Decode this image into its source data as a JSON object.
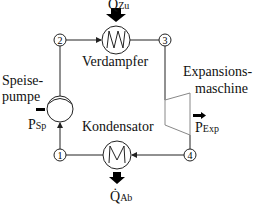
{
  "diagram": {
    "type": "Organic Rankine Cycle schematic",
    "components": {
      "pump": {
        "label_line1": "Speise-",
        "label_line2": "pumpe"
      },
      "evaporator": {
        "label": "Verdampfer"
      },
      "expander": {
        "label_line1": "Expansions-",
        "label_line2": "maschine"
      },
      "condenser": {
        "label": "Kondensator"
      }
    },
    "nodes": [
      "1",
      "2",
      "3",
      "4"
    ],
    "flows": {
      "heat_in": {
        "symbol": "Q̇",
        "subscript": "Zu"
      },
      "heat_out": {
        "symbol": "Q̇",
        "subscript": "Ab"
      },
      "pump_power": {
        "symbol": "P",
        "subscript": "Sp"
      },
      "expander_power": {
        "symbol": "P",
        "subscript": "Exp"
      }
    },
    "colors": {
      "line": "#222222",
      "expander": "#888888",
      "arrow": "#000000"
    }
  }
}
